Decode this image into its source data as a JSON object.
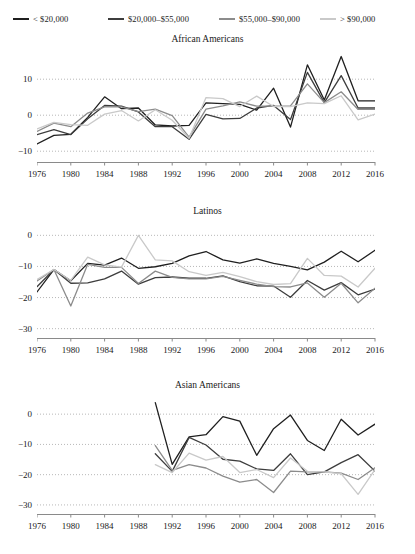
{
  "figure": {
    "width": 415,
    "height": 554
  },
  "legend": {
    "position": "top",
    "items": [
      {
        "label": "< $20,000",
        "color": "#1f1f1f"
      },
      {
        "label": "$20,000–$55,000",
        "color": "#3d3d3d"
      },
      {
        "label": "$55,000–$90,000",
        "color": "#8c8c8c"
      },
      {
        "label": "> $90,000",
        "color": "#c9c9c9"
      }
    ]
  },
  "chart_data": [
    {
      "type": "line",
      "title": "African Americans",
      "xlabel": "",
      "ylabel": "",
      "xlim": [
        1976,
        2016
      ],
      "ylim": [
        -13,
        17
      ],
      "yticks": [
        10,
        0,
        -10
      ],
      "ytick_labels": [
        "10",
        "0",
        "−10"
      ],
      "xticks": [
        1976,
        1980,
        1984,
        1988,
        1992,
        1996,
        2000,
        2004,
        2008,
        2012,
        2016
      ],
      "xtick_labels": [
        "1976",
        "1980",
        "1984",
        "1988",
        "1992",
        "1996",
        "2000",
        "2004",
        "2008",
        "2012",
        "2016"
      ],
      "grid": true,
      "x": [
        1976,
        1978,
        1980,
        1982,
        1984,
        1986,
        1988,
        1990,
        1992,
        1994,
        1996,
        1998,
        2000,
        2002,
        2004,
        2006,
        2008,
        2010,
        2012,
        2014,
        2016
      ],
      "series": [
        {
          "name": "< $20,000",
          "color": "#1f1f1f",
          "values": [
            -8.0,
            -5.6,
            -5.3,
            -0.6,
            5.1,
            1.8,
            2.0,
            -2.7,
            -3.0,
            -2.8,
            3.4,
            3.2,
            3.0,
            1.4,
            7.5,
            -3.3,
            14.0,
            4.2,
            16.3,
            4.0,
            4.0
          ]
        },
        {
          "name": "$20,000–$55,000",
          "color": "#3d3d3d",
          "values": [
            -5.4,
            -4.0,
            -5.4,
            -1.0,
            2.7,
            2.5,
            0.9,
            -3.2,
            -3.2,
            -6.7,
            0.2,
            -1.0,
            -0.9,
            2.0,
            2.7,
            -1.2,
            11.9,
            3.5,
            11.0,
            2.0,
            2.0
          ]
        },
        {
          "name": "$55,000–$90,000",
          "color": "#8c8c8c",
          "values": [
            -4.5,
            -2.2,
            -3.2,
            0.6,
            2.3,
            2.3,
            1.0,
            1.7,
            -0.1,
            -6.1,
            1.7,
            2.6,
            3.7,
            2.5,
            2.5,
            2.6,
            8.7,
            3.5,
            6.5,
            1.6,
            1.6
          ]
        },
        {
          "name": "> $90,000",
          "color": "#c9c9c9",
          "values": [
            -3.8,
            -2.0,
            -2.6,
            -2.8,
            0.3,
            1.3,
            -1.6,
            1.5,
            -1.4,
            -6.4,
            4.9,
            4.6,
            2.4,
            5.3,
            2.4,
            2.4,
            3.4,
            3.2,
            5.4,
            -1.3,
            0.3
          ]
        }
      ]
    },
    {
      "type": "line",
      "title": "Latinos",
      "xlabel": "",
      "ylabel": "",
      "xlim": [
        1976,
        2016
      ],
      "ylim": [
        -33,
        3
      ],
      "yticks": [
        0,
        -10,
        -20,
        -30
      ],
      "ytick_labels": [
        "0",
        "−10",
        "−20",
        "−30"
      ],
      "xticks": [
        1976,
        1980,
        1984,
        1988,
        1992,
        1996,
        2000,
        2004,
        2008,
        2012,
        2016
      ],
      "xtick_labels": [
        "1976",
        "1980",
        "1984",
        "1988",
        "1992",
        "1996",
        "2000",
        "2004",
        "2008",
        "2012",
        "2016"
      ],
      "grid": true,
      "x": [
        1976,
        1978,
        1980,
        1982,
        1984,
        1986,
        1988,
        1990,
        1992,
        1994,
        1996,
        1998,
        2000,
        2002,
        2004,
        2006,
        2008,
        2010,
        2012,
        2014,
        2016
      ],
      "series": [
        {
          "name": "< $20,000",
          "color": "#1f1f1f",
          "values": [
            -18.2,
            -11.0,
            -14.6,
            -9.0,
            -9.6,
            -7.3,
            -10.6,
            -10.1,
            -9.0,
            -6.6,
            -5.2,
            -7.9,
            -8.9,
            -7.6,
            -9.0,
            -10.0,
            -11.1,
            -8.6,
            -5.1,
            -8.5,
            -4.8
          ]
        },
        {
          "name": "$20,000–$55,000",
          "color": "#3d3d3d",
          "values": [
            -16.5,
            -11.0,
            -15.4,
            -15.3,
            -14.0,
            -11.5,
            -15.7,
            -13.6,
            -13.4,
            -13.8,
            -13.8,
            -13.0,
            -14.9,
            -16.2,
            -16.3,
            -19.9,
            -14.5,
            -17.6,
            -15.2,
            -19.1,
            -17.3
          ]
        },
        {
          "name": "$55,000–$90,000",
          "color": "#8c8c8c",
          "values": [
            -14.7,
            -11.0,
            -22.7,
            -9.3,
            -10.3,
            -10.3,
            -15.5,
            -11.5,
            -13.5,
            -14.0,
            -14.0,
            -13.2,
            -14.5,
            -15.7,
            -16.5,
            -16.6,
            -15.3,
            -19.9,
            -15.4,
            -21.7,
            -17.0
          ]
        },
        {
          "name": "> $90,000",
          "color": "#c9c9c9",
          "values": [
            -14.2,
            -11.0,
            -14.5,
            -7.0,
            -9.5,
            -10.2,
            0.0,
            -7.9,
            -8.2,
            -11.7,
            -12.9,
            -11.9,
            -13.3,
            -14.9,
            -15.8,
            -15.5,
            -7.4,
            -12.9,
            -13.1,
            -16.6,
            -10.6
          ]
        }
      ]
    },
    {
      "type": "line",
      "title": "Asian Americans",
      "xlabel": "",
      "ylabel": "",
      "xlim": [
        1976,
        2016
      ],
      "ylim": [
        -33,
        6
      ],
      "yticks": [
        0,
        -10,
        -20,
        -30
      ],
      "ytick_labels": [
        "0",
        "−10",
        "−20",
        "−30"
      ],
      "xticks": [
        1976,
        1980,
        1984,
        1988,
        1992,
        1996,
        2000,
        2004,
        2008,
        2012,
        2016
      ],
      "xtick_labels": [
        "1976",
        "1980",
        "1984",
        "1988",
        "1992",
        "1996",
        "2000",
        "2004",
        "2008",
        "2012",
        "2016"
      ],
      "grid": true,
      "x": [
        1990,
        1992,
        1994,
        1996,
        1998,
        2000,
        2002,
        2004,
        2006,
        2008,
        2010,
        2012,
        2014,
        2016
      ],
      "series": [
        {
          "name": "< $20,000",
          "color": "#1f1f1f",
          "values": [
            3.8,
            -16.6,
            -7.5,
            -6.8,
            -0.8,
            -2.3,
            -13.6,
            -4.8,
            -0.3,
            -8.7,
            -12.0,
            -1.7,
            -6.9,
            -3.3
          ]
        },
        {
          "name": "$20,000–$55,000",
          "color": "#3d3d3d",
          "values": [
            -13.1,
            -18.9,
            -7.7,
            -10.2,
            -14.9,
            -15.5,
            -18.1,
            -18.6,
            -13.1,
            -20.0,
            -19.1,
            -16.0,
            -13.4,
            -18.8
          ]
        },
        {
          "name": "$55,000–$90,000",
          "color": "#8c8c8c",
          "values": [
            -10.4,
            -18.6,
            -16.7,
            -17.8,
            -20.5,
            -22.5,
            -21.6,
            -25.9,
            -18.8,
            -19.1,
            -19.1,
            -19.5,
            -21.6,
            -17.7
          ]
        },
        {
          "name": "> $90,000",
          "color": "#c9c9c9",
          "values": [
            -16.7,
            -19.3,
            -12.9,
            -15.2,
            -14.0,
            -19.3,
            -18.3,
            -21.0,
            -14.5,
            -18.9,
            -19.1,
            -19.7,
            -26.5,
            -18.3
          ]
        }
      ]
    }
  ]
}
